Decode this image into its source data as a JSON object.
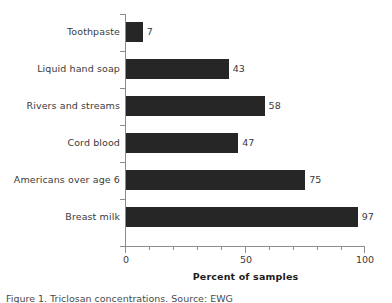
{
  "chart_data": {
    "type": "bar",
    "orientation": "horizontal",
    "title": "",
    "xlabel": "Percent of samples",
    "ylabel": "",
    "xlim": [
      0,
      100
    ],
    "xticks": [
      0,
      50,
      100
    ],
    "xtick_labels": [
      "0",
      "50",
      "100"
    ],
    "minor_tick_step": 10,
    "grid": false,
    "legend": null,
    "bar_color": "#262626",
    "axis_color": "#8c8c8c",
    "label_color": "#3a3a3a",
    "categories": [
      "Toothpaste",
      "Liquid hand soap",
      "Rivers and streams",
      "Cord blood",
      "Americans over age 6",
      "Breast milk"
    ],
    "values": [
      7,
      43,
      58,
      47,
      75,
      97
    ],
    "value_labels": [
      "7",
      "43",
      "58",
      "47",
      "75",
      "97"
    ]
  },
  "caption": {
    "text": "Figure 1. Triclosan concentrations. Source: EWG"
  }
}
